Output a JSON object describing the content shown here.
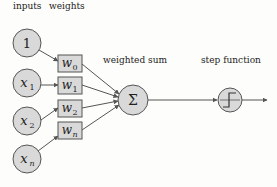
{
  "labels": {
    "inputs": "inputs",
    "weights": "weights",
    "weighted_sum": "weighted sum",
    "step_function": "step function"
  },
  "inputs": [
    {
      "main": "1",
      "sub": ""
    },
    {
      "main": "x",
      "sub": "1"
    },
    {
      "main": "x",
      "sub": "2"
    },
    {
      "main": "x",
      "sub": "n"
    }
  ],
  "weights": [
    {
      "main": "w",
      "sub": "0"
    },
    {
      "main": "w",
      "sub": "1"
    },
    {
      "main": "w",
      "sub": "2"
    },
    {
      "main": "w",
      "sub": "n"
    }
  ],
  "sum_symbol": "Σ",
  "colors": {
    "node_fill": "#d9d9d9",
    "stroke": "#555555",
    "background": "#fdfdfb"
  }
}
